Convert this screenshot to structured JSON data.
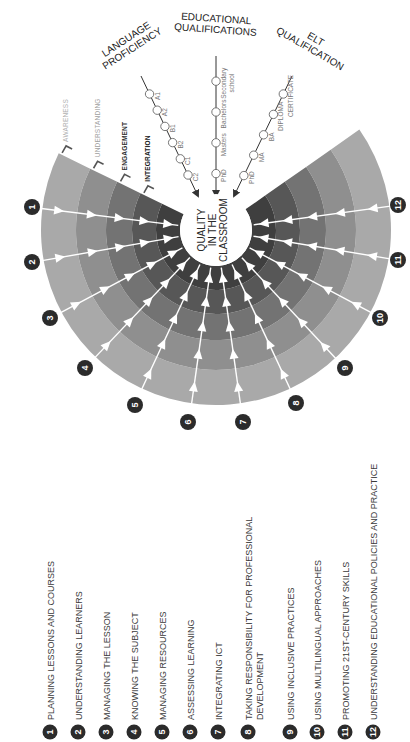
{
  "orientation": "rotated-90-ccw",
  "center": {
    "lines": [
      "QUALITY",
      "IN THE",
      "CLASSROOM"
    ]
  },
  "rings": [
    {
      "label": "AWARENESS",
      "color": "#a9a9a9",
      "label_color": "#b0b0b0"
    },
    {
      "label": "UNDERSTANDING",
      "color": "#8f8f8f",
      "label_color": "#a0a0a0"
    },
    {
      "label": "ENGAGEMENT",
      "color": "#737373",
      "label_color": "#303030"
    },
    {
      "label": "INTEGRATION",
      "color": "#575757",
      "label_color": "#202020"
    },
    {
      "label": "",
      "color": "#3f3f3f",
      "label_color": "#202020"
    }
  ],
  "axes": [
    {
      "title_lines": [
        "LANGUAGE",
        "PROFICIENCY"
      ],
      "ticks": [
        "A1",
        "A2",
        "B1",
        "B2",
        "C1",
        "C2"
      ]
    },
    {
      "title_lines": [
        "EDUCATIONAL",
        "QUALIFICATIONS"
      ],
      "ticks": [
        "Secondary school",
        "Bachelors",
        "Masters",
        "PhD"
      ]
    },
    {
      "title_lines": [
        "ELT",
        "QUALIFICATION"
      ],
      "ticks": [
        "CERTIFICATE",
        "DIPLOMA",
        "BA",
        "MA",
        "PhD"
      ]
    }
  ],
  "competencies": [
    {
      "num": "1",
      "label": "PLANNING LESSONS AND COURSES"
    },
    {
      "num": "2",
      "label": "UNDERSTANDING LEARNERS"
    },
    {
      "num": "3",
      "label": "MANAGING THE LESSON"
    },
    {
      "num": "4",
      "label": "KNOWING THE SUBJECT"
    },
    {
      "num": "5",
      "label": "MANAGING RESOURCES"
    },
    {
      "num": "6",
      "label": "ASSESSING LEARNING"
    },
    {
      "num": "7",
      "label": "INTEGRATING ICT"
    },
    {
      "num": "8",
      "label": "TAKING RESPONSIBILITY FOR PROFESSIONAL DEVELOPMENT",
      "lines": [
        "TAKING RESPONSIBILITY FOR PROFESSIONAL",
        "DEVELOPMENT"
      ]
    },
    {
      "num": "9",
      "label": "USING INCLUSIVE PRACTICES"
    },
    {
      "num": "10",
      "label": "USING MULTILINGUAL APPROACHES"
    },
    {
      "num": "11",
      "label": "PROMOTING 21ST-CENTURY SKILLS"
    },
    {
      "num": "12",
      "label": "UNDERSTANDING EDUCATIONAL POLICIES AND PRACTICE"
    }
  ],
  "colors": {
    "badge": "#2b2b2b",
    "spoke": "#ffffff",
    "axis_line": "#333333",
    "text_dark": "#1a1a1a"
  }
}
